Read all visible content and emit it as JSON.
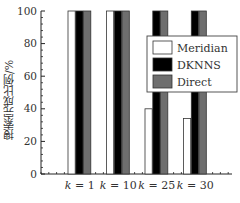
{
  "chart_data": {
    "type": "bar",
    "title": "",
    "xlabel": "",
    "ylabel": "搜索完成比例/%",
    "ylim": [
      0,
      100
    ],
    "yticks": [
      0,
      20,
      40,
      60,
      80,
      100
    ],
    "categories": [
      "k = 1",
      "k = 10",
      "k = 25",
      "k = 30"
    ],
    "series": [
      {
        "name": "Meridian",
        "color": "#ffffff",
        "values": [
          100,
          100,
          40,
          34
        ]
      },
      {
        "name": "DKNNS",
        "color": "#000000",
        "values": [
          100,
          100,
          100,
          100
        ]
      },
      {
        "name": "Direct",
        "color": "#6e6e6e",
        "values": [
          100,
          100,
          100,
          100
        ]
      }
    ],
    "legend_position": "upper right, inside",
    "grid": false
  }
}
